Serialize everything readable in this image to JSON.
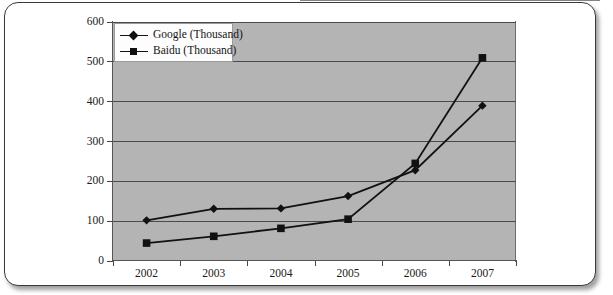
{
  "page": {
    "background_color": "#ffffff",
    "card_border_color": "#3a3a3a"
  },
  "chart": {
    "plot_background_color": "#b4b4b4",
    "axis_color": "#4a4a4a",
    "series_color": "#111111",
    "legend": {
      "entries": [
        {
          "label": "Google (Thousand)",
          "marker": "diamond-marker-icon"
        },
        {
          "label": "Baidu (Thousand)",
          "marker": "square-marker-icon"
        }
      ]
    }
  },
  "chart_data": {
    "type": "line",
    "title": "",
    "subtitle": "",
    "xlabel": "",
    "ylabel": "",
    "categories": [
      "2002",
      "2003",
      "2004",
      "2005",
      "2006",
      "2007"
    ],
    "x": [
      2002,
      2003,
      2004,
      2005,
      2006,
      2007
    ],
    "series": [
      {
        "name": "Google (Thousand)",
        "marker": "diamond",
        "color": "#111111",
        "values": [
          102,
          131,
          132,
          163,
          228,
          390
        ]
      },
      {
        "name": "Baidu (Thousand)",
        "marker": "square",
        "color": "#111111",
        "values": [
          45,
          62,
          82,
          105,
          245,
          510
        ]
      }
    ],
    "ylim": [
      0,
      600
    ],
    "yticks": [
      0,
      100,
      200,
      300,
      400,
      500,
      600
    ],
    "ytick_labels": [
      "0",
      "100",
      "200",
      "300",
      "400",
      "500",
      "600"
    ],
    "xtick_labels": [
      "2002",
      "2003",
      "2004",
      "2005",
      "2006",
      "2007"
    ],
    "grid": true,
    "grid_axis": "y",
    "legend_position": "top-left"
  }
}
